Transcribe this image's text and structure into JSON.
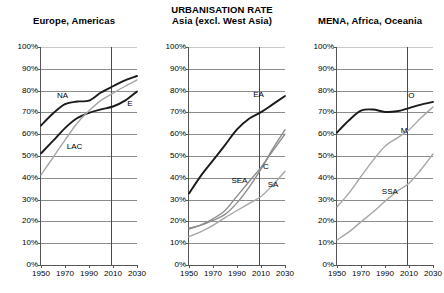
{
  "chart_data": {
    "type": "line",
    "title": "URBANISATION RATE",
    "xlabel": "",
    "ylabel": "",
    "xlim": [
      1950,
      2030
    ],
    "ylim": [
      0,
      100
    ],
    "grid": true,
    "legend_position": "inline-labels",
    "x_ticks": [
      "1950",
      "1970",
      "1990",
      "2010",
      "2030"
    ],
    "x_tick_values": [
      1950,
      1970,
      1990,
      2010,
      2030
    ],
    "y_ticks": [
      "0%",
      "10%",
      "20%",
      "30%",
      "40%",
      "50%",
      "60%",
      "70%",
      "80%",
      "90%",
      "100%"
    ],
    "y_tick_values": [
      0,
      10,
      20,
      30,
      40,
      50,
      60,
      70,
      80,
      90,
      100
    ],
    "annotations": [
      {
        "text": "vertical reference line at 2008 separating historical estimates from projections",
        "x": 2008
      }
    ],
    "x": [
      1950,
      1960,
      1970,
      1980,
      1990,
      2000,
      2010,
      2020,
      2030
    ],
    "panels": [
      {
        "id": "europe-americas",
        "title_lines": [
          "Europe, Americas"
        ],
        "divider_x": 2008,
        "series": [
          {
            "name": "NA",
            "label": "NA",
            "full_name": "North America",
            "color": "#1a1a1a",
            "width": 1.9,
            "values": [
              64,
              69.5,
              73.8,
              75.0,
              75.4,
              79.1,
              82.0,
              84.7,
              86.7
            ],
            "label_at": {
              "x": 1968,
              "y": 77.5
            }
          },
          {
            "name": "E",
            "label": "E",
            "full_name": "Europe",
            "color": "#1a1a1a",
            "width": 1.9,
            "values": [
              51.2,
              56.9,
              62.8,
              67.3,
              69.8,
              71.4,
              72.7,
              75.4,
              79.6
            ],
            "label_at": {
              "x": 2024,
              "y": 74.0
            }
          },
          {
            "name": "LAC",
            "label": "LAC",
            "full_name": "Latin America and the Caribbean",
            "color": "#a6a6a6",
            "width": 1.4,
            "values": [
              41.3,
              49.3,
              57.3,
              64.9,
              70.7,
              75.5,
              78.8,
              82.0,
              84.9
            ],
            "label_at": {
              "x": 1978,
              "y": 54.0
            }
          }
        ]
      },
      {
        "id": "asia-excl-west-asia",
        "title_lines": [
          "URBANISATION RATE",
          "Asia (excl. West Asia)"
        ],
        "divider_x": 2008,
        "series": [
          {
            "name": "EA",
            "label": "EA",
            "full_name": "East Asia",
            "color": "#1a1a1a",
            "width": 1.9,
            "values": [
              32.8,
              41.0,
              48.0,
              55.0,
              62.2,
              67.1,
              70.1,
              73.8,
              77.5
            ],
            "label_at": {
              "x": 2008,
              "y": 78.0
            }
          },
          {
            "name": "SEA",
            "label": "SEA",
            "full_name": "South-East Asia",
            "color": "#8c8c8c",
            "width": 1.4,
            "values": [
              16.5,
              18.4,
              21.2,
              25.0,
              31.6,
              38.2,
              44.8,
              52.5,
              60.0
            ],
            "label_at": {
              "x": 1992,
              "y": 38.5
            }
          },
          {
            "name": "C",
            "label": "C",
            "full_name": "China",
            "color": "#8c8c8c",
            "width": 1.4,
            "values": [
              16.9,
              18.3,
              20.5,
              23.2,
              28.5,
              35.6,
              44.0,
              53.5,
              62.0
            ],
            "label_at": {
              "x": 2014,
              "y": 45.0
            }
          },
          {
            "name": "SA",
            "label": "SA",
            "full_name": "South Asia",
            "color": "#a6a6a6",
            "width": 1.4,
            "values": [
              13.0,
              15.3,
              18.2,
              21.7,
              25.0,
              28.2,
              31.4,
              36.8,
              43.0
            ],
            "label_at": {
              "x": 2020,
              "y": 36.5
            }
          }
        ]
      },
      {
        "id": "mena-africa-oceania",
        "title_lines": [
          "MENA, Africa, Oceania"
        ],
        "divider_x": 2008,
        "series": [
          {
            "name": "O",
            "label": "O",
            "full_name": "Oceania",
            "color": "#1a1a1a",
            "width": 1.9,
            "values": [
              60.8,
              66.4,
              70.8,
              71.3,
              70.2,
              70.5,
              72.0,
              73.6,
              74.8
            ],
            "label_at": {
              "x": 2012,
              "y": 77.5
            }
          },
          {
            "name": "M",
            "label": "M",
            "full_name": "Middle East and North Africa",
            "color": "#a6a6a6",
            "width": 1.4,
            "values": [
              26.7,
              33.0,
              40.6,
              48.0,
              54.5,
              58.2,
              62.0,
              67.5,
              72.5
            ],
            "label_at": {
              "x": 2006,
              "y": 61.5
            }
          },
          {
            "name": "SSA",
            "label": "SSA",
            "full_name": "Sub-Saharan Africa",
            "color": "#a6a6a6",
            "width": 1.4,
            "values": [
              11.5,
              15.2,
              19.8,
              24.3,
              29.2,
              33.8,
              37.5,
              43.8,
              50.9
            ],
            "label_at": {
              "x": 1994,
              "y": 33.5
            }
          }
        ]
      }
    ]
  }
}
